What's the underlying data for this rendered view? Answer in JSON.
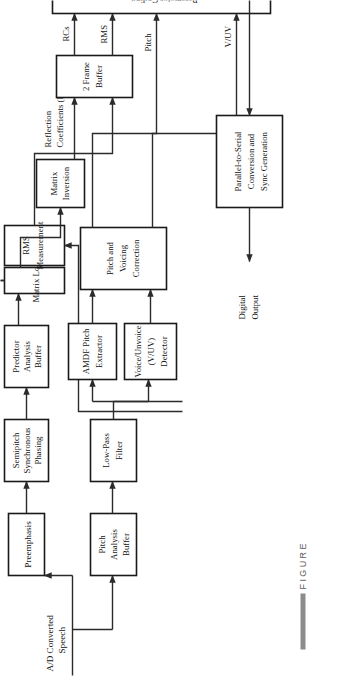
{
  "figure": {
    "caption_label": "FIGURE",
    "type": "block-diagram",
    "orientation": "rotated-90-ccw",
    "colors": {
      "background": "#ffffff",
      "box_stroke": "#1a1a1a",
      "box_fill": "#ffffff",
      "connector": "#2b2b2b",
      "caption_text": "#5a5a5a",
      "caption_bar": "#8c8c8c"
    }
  },
  "blocks": [
    {
      "id": "preemphasis",
      "lines": [
        "Preemphasis"
      ]
    },
    {
      "id": "semipitch",
      "lines": [
        "Semipitch",
        "Synchronous",
        "Phasing"
      ]
    },
    {
      "id": "predictor",
      "lines": [
        "Predictor",
        "Analysis",
        "Buffer"
      ]
    },
    {
      "id": "matrix_load",
      "lines": [
        "Matrix Load"
      ]
    },
    {
      "id": "rms_measurement",
      "lines": [
        "RMS",
        "Measurement"
      ]
    },
    {
      "id": "matrix_inversion",
      "lines": [
        "Matrix",
        "Inversion"
      ]
    },
    {
      "id": "two_frame_buffer",
      "lines": [
        "2 Frame",
        "Buffer"
      ]
    },
    {
      "id": "parameter_coding",
      "lines": [
        "Parameter Coding"
      ]
    },
    {
      "id": "parallel_serial",
      "lines": [
        "Parallel-to-Serial",
        "Conversion and",
        "Sync Generation"
      ]
    },
    {
      "id": "pitch_analysis",
      "lines": [
        "Pitch",
        "Analysis",
        "Buffer"
      ]
    },
    {
      "id": "low_pass",
      "lines": [
        "Low-Pass",
        "Filter"
      ]
    },
    {
      "id": "amdf",
      "lines": [
        "AMDF Pitch",
        "Extractor"
      ]
    },
    {
      "id": "vuv_detector",
      "lines": [
        "Voice/Unvoice",
        "(V/UV)",
        "Detector"
      ]
    },
    {
      "id": "pitch_voicing",
      "lines": [
        "Pitch and",
        "Voicing",
        "Correction"
      ]
    }
  ],
  "edge_labels": [
    {
      "id": "input",
      "lines": [
        "A/D Converted",
        "Speech"
      ]
    },
    {
      "id": "reflection_coeff",
      "lines": [
        "Reflection",
        "Coefficients (RC)"
      ]
    },
    {
      "id": "rcs",
      "lines": [
        "RCs"
      ]
    },
    {
      "id": "rms",
      "lines": [
        "RMS"
      ]
    },
    {
      "id": "pitch",
      "lines": [
        "Pitch"
      ]
    },
    {
      "id": "vuv",
      "lines": [
        "V/UV"
      ]
    },
    {
      "id": "output",
      "lines": [
        "Digital",
        "Output"
      ]
    }
  ]
}
